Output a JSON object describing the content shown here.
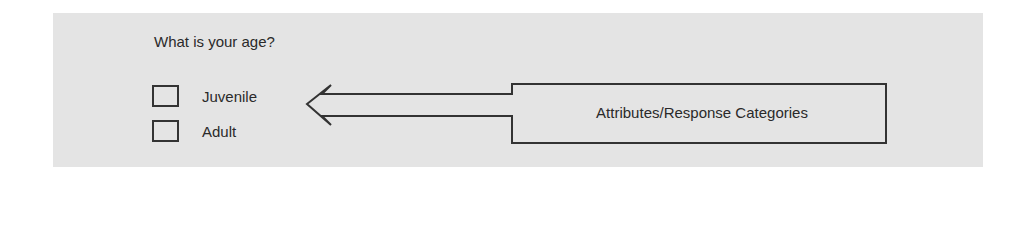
{
  "question": {
    "text": "What is your age?"
  },
  "options": [
    {
      "label": "Juvenile",
      "checked": false
    },
    {
      "label": "Adult",
      "checked": false
    }
  ],
  "callout": {
    "label": "Attributes/Response Categories",
    "arrow_direction": "left"
  },
  "colors": {
    "panel_background": "#e4e4e4",
    "stroke": "#333333",
    "text": "#2a2a2a"
  }
}
